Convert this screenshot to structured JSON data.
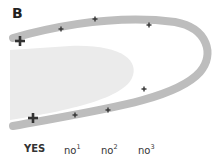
{
  "panel": {
    "label": "B"
  },
  "colors": {
    "loop": "#bdbdbd",
    "shaded_region": "#ebebeb",
    "marker": "#333333"
  },
  "markers": {
    "large": [
      {
        "x": 20,
        "y": 41
      },
      {
        "x": 33,
        "y": 118
      }
    ],
    "small": [
      {
        "x": 61,
        "y": 29
      },
      {
        "x": 95,
        "y": 19
      },
      {
        "x": 149,
        "y": 25
      },
      {
        "x": 144,
        "y": 89
      },
      {
        "x": 108,
        "y": 110
      },
      {
        "x": 75,
        "y": 115
      }
    ]
  },
  "axis": {
    "labels": [
      {
        "base": "YES",
        "sup": "",
        "bold": true
      },
      {
        "base": "no",
        "sup": "1",
        "bold": false
      },
      {
        "base": "no",
        "sup": "2",
        "bold": false
      },
      {
        "base": "no",
        "sup": "3",
        "bold": false
      }
    ]
  }
}
